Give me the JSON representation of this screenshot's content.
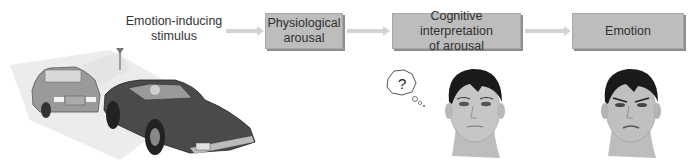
{
  "diagram": {
    "type": "flow",
    "steps": [
      {
        "id": "stimulus",
        "label_line1": "Emotion-inducing",
        "label_line2": "stimulus",
        "boxed": false
      },
      {
        "id": "arousal",
        "label_line1": "Physiological",
        "label_line2": "arousal",
        "boxed": true
      },
      {
        "id": "cognition",
        "label_line1": "Cognitive interpretation",
        "label_line2": "of arousal",
        "boxed": true
      },
      {
        "id": "emotion",
        "label_line1": "Emotion",
        "label_line2": "",
        "boxed": true
      }
    ],
    "edges": [
      {
        "from": "stimulus",
        "to": "arousal"
      },
      {
        "from": "arousal",
        "to": "cognition"
      },
      {
        "from": "cognition",
        "to": "emotion"
      }
    ],
    "illustrations": {
      "cars": "two-cars-near-collision",
      "face_confused": "face-with-question-thought-bubble",
      "face_emotion": "angry-face",
      "thought_bubble_text": "?"
    },
    "colors": {
      "box_fill": "#bdbdbd",
      "arrow": "#d4d4d4",
      "text": "#333333"
    }
  }
}
